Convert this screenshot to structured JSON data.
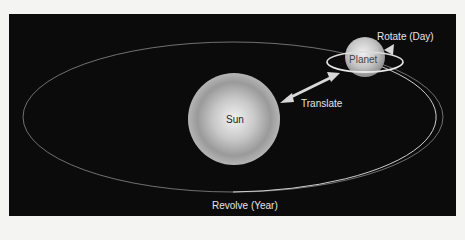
{
  "diagram": {
    "labels": {
      "sun": "Sun",
      "planet": "Planet",
      "translate": "Translate",
      "rotate": "Rotate (Day)",
      "revolve": "Revolve (Year)"
    },
    "colors": {
      "background": "#0b0b0b",
      "page": "#f4f4f2",
      "orbit": "#cfcfcf",
      "arrow": "#d8d8d8"
    }
  }
}
